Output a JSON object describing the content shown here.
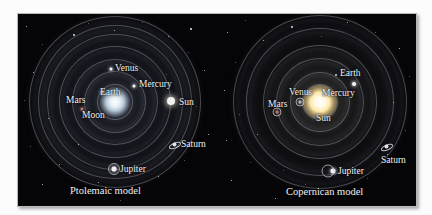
{
  "figure": {
    "background_color": "#050507",
    "frame_color": "#b9b9b9",
    "label_color": "#f4f4f4"
  },
  "panels": [
    {
      "id": "ptolemaic",
      "caption": "Ptolemaic model",
      "center_body": "Earth",
      "bodies": [
        {
          "name": "Venus",
          "label": "Venus"
        },
        {
          "name": "Mercury",
          "label": "Mercury"
        },
        {
          "name": "Earth",
          "label": "Earth"
        },
        {
          "name": "Mars",
          "label": "Mars"
        },
        {
          "name": "Moon",
          "label": "Moon"
        },
        {
          "name": "Sun",
          "label": "Sun"
        },
        {
          "name": "Saturn",
          "label": "Saturn"
        },
        {
          "name": "Jupiter",
          "label": "Jupiter"
        }
      ]
    },
    {
      "id": "copernican",
      "caption": "Copernican model",
      "center_body": "Sun",
      "bodies": [
        {
          "name": "Earth",
          "label": "Earth"
        },
        {
          "name": "Venus",
          "label": "Venus"
        },
        {
          "name": "Mercury",
          "label": "Mercury"
        },
        {
          "name": "Mars",
          "label": "Mars"
        },
        {
          "name": "Sun",
          "label": "Sun"
        },
        {
          "name": "Saturn",
          "label": "Saturn"
        },
        {
          "name": "Jupiter",
          "label": "Jupiter"
        }
      ]
    }
  ]
}
